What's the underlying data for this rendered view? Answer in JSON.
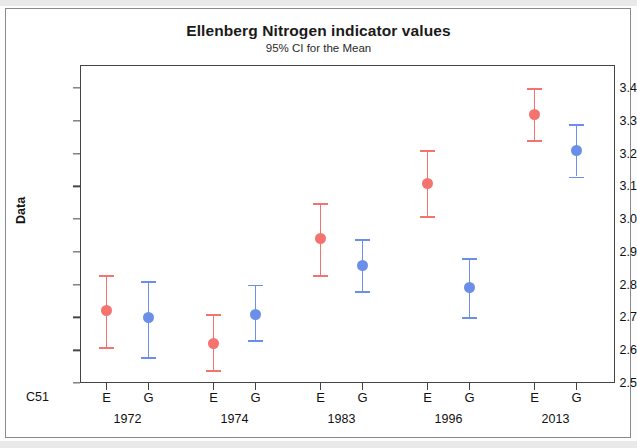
{
  "chart_data": {
    "type": "scatter",
    "title": "Ellenberg Nitrogen indicator values",
    "subtitle": "95% CI for the Mean",
    "ylabel": "Data",
    "xlabel": "",
    "xaxis_name": "C51",
    "ylim": [
      2.5,
      3.4
    ],
    "ytick_labels": [
      "3.4",
      "3.3",
      "3.2",
      "3.1",
      "3.0",
      "2.9",
      "2.8",
      "2.7",
      "2.6",
      "2.5"
    ],
    "ytick_values": [
      3.4,
      3.3,
      3.2,
      3.1,
      3.0,
      2.9,
      2.8,
      2.7,
      2.6,
      2.5
    ],
    "grid": false,
    "legend": "none",
    "groups": [
      "1972",
      "1974",
      "1983",
      "1996",
      "2013"
    ],
    "subcategories": [
      "E",
      "G"
    ],
    "colors": {
      "E": "#f4736e",
      "G": "#6b8ee8",
      "axis": "#444444",
      "text": "#111111"
    },
    "points": [
      {
        "group": "1972",
        "sub": "E",
        "mean": 2.72,
        "lower": 2.61,
        "upper": 2.83,
        "color": "#f4736e"
      },
      {
        "group": "1972",
        "sub": "G",
        "mean": 2.7,
        "lower": 2.58,
        "upper": 2.81,
        "color": "#6b8ee8"
      },
      {
        "group": "1974",
        "sub": "E",
        "mean": 2.62,
        "lower": 2.54,
        "upper": 2.71,
        "color": "#f4736e"
      },
      {
        "group": "1974",
        "sub": "G",
        "mean": 2.71,
        "lower": 2.63,
        "upper": 2.8,
        "color": "#6b8ee8"
      },
      {
        "group": "1983",
        "sub": "E",
        "mean": 2.94,
        "lower": 2.83,
        "upper": 3.05,
        "color": "#f4736e"
      },
      {
        "group": "1983",
        "sub": "G",
        "mean": 2.86,
        "lower": 2.78,
        "upper": 2.94,
        "color": "#6b8ee8"
      },
      {
        "group": "1996",
        "sub": "E",
        "mean": 3.11,
        "lower": 3.01,
        "upper": 3.21,
        "color": "#f4736e"
      },
      {
        "group": "1996",
        "sub": "G",
        "mean": 2.79,
        "lower": 2.7,
        "upper": 2.88,
        "color": "#6b8ee8"
      },
      {
        "group": "2013",
        "sub": "E",
        "mean": 3.32,
        "lower": 3.24,
        "upper": 3.4,
        "color": "#f4736e"
      },
      {
        "group": "2013",
        "sub": "G",
        "mean": 3.21,
        "lower": 3.13,
        "upper": 3.29,
        "color": "#6b8ee8"
      }
    ]
  }
}
